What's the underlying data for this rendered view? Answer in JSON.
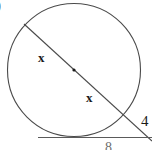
{
  "figure": {
    "stroke_color": "#4a4a4a",
    "tangent_color": "#5a5a5a",
    "text_color": "#1a1a1a",
    "background": "#ffffff",
    "circle": {
      "cx": 74,
      "cy": 70,
      "r": 66.5
    },
    "center_point": {
      "cx": 74,
      "cy": 70,
      "r": 1.6
    },
    "secant": {
      "x1": 24,
      "y1": 24,
      "x2": 152,
      "y2": 141
    },
    "tangent": {
      "x1": 38,
      "y1": 137.5,
      "x2": 152,
      "y2": 137.5
    }
  },
  "labels": {
    "item_marker": ")",
    "x_upper": "x",
    "x_lower": "x",
    "tangent_length": "4",
    "bottom_partial": "8"
  }
}
